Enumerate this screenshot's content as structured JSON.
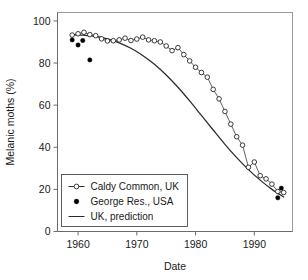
{
  "chart_data": {
    "type": "line",
    "title": "",
    "xlabel": "Date",
    "ylabel": "Melanic moths (%)",
    "xlim": [
      1956.5,
      1996.5
    ],
    "ylim": [
      0,
      104
    ],
    "xticks": [
      1960,
      1970,
      1980,
      1990
    ],
    "yticks": [
      0,
      20,
      40,
      60,
      80,
      100
    ],
    "grid": false,
    "legend_position": "bottom-left",
    "series": [
      {
        "name": "Caldy Common, UK",
        "marker": "open-circle",
        "line": "thin-connector",
        "x": [
          1959,
          1960,
          1961,
          1962,
          1963,
          1964,
          1965,
          1966,
          1967,
          1968,
          1969,
          1970,
          1971,
          1972,
          1973,
          1974,
          1975,
          1976,
          1977,
          1978,
          1979,
          1980,
          1981,
          1982,
          1983,
          1984,
          1985,
          1986,
          1987,
          1988,
          1989,
          1990,
          1991,
          1992,
          1993,
          1994,
          1995
        ],
        "values": [
          93.3,
          93.9,
          94.6,
          93.5,
          93.0,
          91.5,
          90.5,
          90.6,
          91.0,
          91.8,
          90.7,
          91.4,
          92.3,
          91.0,
          90.6,
          90.0,
          88.1,
          85.9,
          87.3,
          84.0,
          81.0,
          78.0,
          75.5,
          73.3,
          67.5,
          63.0,
          57.0,
          51.0,
          45.0,
          41.0,
          30.5,
          33.0,
          26.5,
          25.0,
          22.5,
          19.0,
          18.5
        ]
      },
      {
        "name": "George Res., USA",
        "marker": "filled-circle",
        "line": "none",
        "x": [
          1959,
          1960,
          1960.8,
          1962,
          1994,
          1994.6
        ],
        "values": [
          91.0,
          88.6,
          90.7,
          81.5,
          16.0,
          20.6
        ]
      },
      {
        "name": "UK, prediction",
        "marker": "none",
        "line": "solid",
        "x": [
          1959,
          1961,
          1963,
          1965,
          1967,
          1969,
          1971,
          1973,
          1975,
          1977,
          1979,
          1981,
          1983,
          1985,
          1987,
          1989,
          1991,
          1993,
          1995
        ],
        "values": [
          93.4,
          93.2,
          92.7,
          91.5,
          89.6,
          87.0,
          83.6,
          79.4,
          74.3,
          68.5,
          62.0,
          55.1,
          48.2,
          41.4,
          35.1,
          29.4,
          24.4,
          20.0,
          16.4
        ]
      }
    ]
  },
  "legend": {
    "items": [
      {
        "label": "Caldy Common, UK",
        "swatch": "open-circle-line"
      },
      {
        "label": "George Res., USA",
        "swatch": "filled-circle"
      },
      {
        "label": "UK, prediction",
        "swatch": "solid-line"
      }
    ]
  },
  "colors": {
    "background": "#ffffff",
    "axis": "#6b6b6b",
    "frame": "#9a9a9a",
    "line": "#2b2b2b",
    "marker_fill_open": "#ffffff",
    "marker_fill_solid": "#000000",
    "text": "#1a1a1a"
  }
}
